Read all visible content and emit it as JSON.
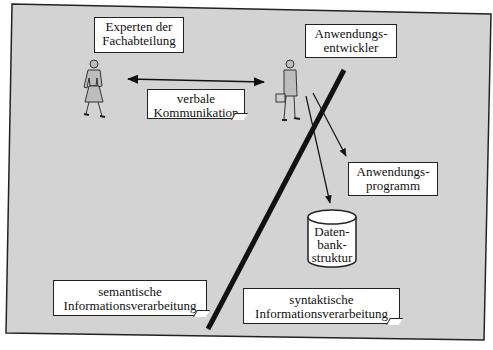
{
  "diagram": {
    "background_color": "#d3d3d3",
    "frame_color": "#222222",
    "labels": {
      "experts": [
        "Experten der",
        "Fachabteilung"
      ],
      "developer": [
        "Anwendungs-",
        "entwickler"
      ],
      "verbal": [
        "verbale",
        "Kommunikation"
      ],
      "program": [
        "Anwendungs-",
        "programm"
      ],
      "database": [
        "Daten-",
        "bank-",
        "struktur"
      ],
      "semantic": [
        "semantische",
        "Informationsverarbeitung"
      ],
      "syntactic": [
        "syntaktische",
        "Informationsverarbeitung"
      ]
    },
    "icons": {
      "expert_figure": "woman-figure-icon",
      "developer_figure": "businessman-with-briefcase-icon",
      "database": "database-cylinder-icon"
    },
    "connections": [
      {
        "from": "expert",
        "to": "developer",
        "type": "bidirectional-arrow",
        "label": "verbale Kommunikation"
      },
      {
        "from": "developer",
        "to": "program",
        "type": "arrow"
      },
      {
        "from": "developer",
        "to": "database",
        "type": "arrow"
      }
    ],
    "divider": "thick diagonal line separating semantic and syntactic information processing"
  }
}
